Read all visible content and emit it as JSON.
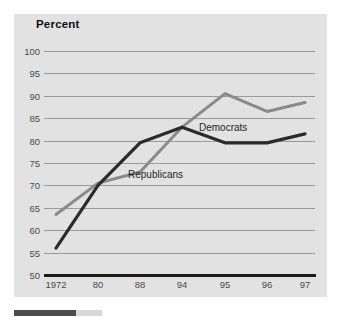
{
  "chart_data": {
    "type": "line",
    "title": "Percent",
    "xlabel": "",
    "ylabel": "",
    "ylim": [
      50,
      100
    ],
    "yticks": [
      100,
      95,
      90,
      85,
      80,
      75,
      70,
      65,
      60,
      55,
      50
    ],
    "grid": true,
    "legend": "inline-labels",
    "categories": [
      "1972",
      "80",
      "88",
      "94",
      "95",
      "96",
      "97"
    ],
    "series": [
      {
        "name": "Democrats",
        "color": "#8a8a8a",
        "values": [
          63.5,
          70.5,
          73.0,
          83.0,
          90.5,
          86.5,
          88.5
        ]
      },
      {
        "name": "Republicans",
        "color": "#2b2b2b",
        "values": [
          56.0,
          70.0,
          79.5,
          83.0,
          79.5,
          79.5,
          81.5
        ]
      }
    ],
    "annotations": [
      {
        "text": "Republicans",
        "x": "88",
        "y": 72.5
      },
      {
        "text": "Democrats",
        "x": "95",
        "y": 83.5
      }
    ]
  },
  "colors": {
    "panel_background": "#e2e2e2",
    "page_background": "#ffffff",
    "gridline": "#9a9a9a",
    "axis": "#1a1a1a",
    "tick_text": "#4a4a4a",
    "title_text": "#111111",
    "democrats_line": "#8a8a8a",
    "republicans_line": "#2b2b2b",
    "footer_bar": "#4c4c4c"
  },
  "yticks": {
    "t0": "100",
    "t1": "95",
    "t2": "90",
    "t3": "85",
    "t4": "80",
    "t5": "75",
    "t6": "70",
    "t7": "65",
    "t8": "60",
    "t9": "55",
    "t10": "50"
  },
  "xticks": {
    "x0": "1972",
    "x1": "80",
    "x2": "88",
    "x3": "94",
    "x4": "95",
    "x5": "96",
    "x6": "97"
  },
  "labels": {
    "republicans": "Republicans",
    "democrats": "Democrats"
  }
}
